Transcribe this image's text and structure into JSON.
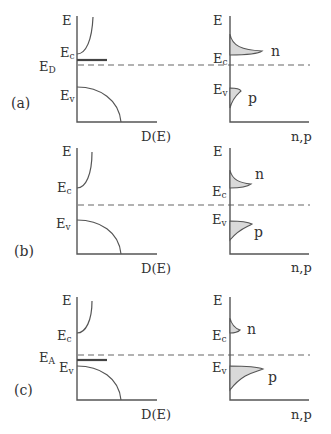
{
  "figure": {
    "panels": [
      {
        "id": "a",
        "tag": "(a)",
        "type": "n-type",
        "left": {
          "e_axis": "E",
          "ec": "E",
          "ec_sub": "c",
          "ev": "E",
          "ev_sub": "v",
          "level": "E",
          "level_sub": "D",
          "x_axis": "D(E)"
        },
        "right": {
          "e_axis": "E",
          "ec": "E",
          "ec_sub": "c",
          "ev": "E",
          "ev_sub": "v",
          "n_label": "n",
          "p_label": "p",
          "x_axis": "n,p"
        }
      },
      {
        "id": "b",
        "tag": "(b)",
        "type": "intrinsic",
        "left": {
          "e_axis": "E",
          "ec": "E",
          "ec_sub": "c",
          "ev": "E",
          "ev_sub": "v",
          "x_axis": "D(E)"
        },
        "right": {
          "e_axis": "E",
          "ec": "E",
          "ec_sub": "c",
          "ev": "E",
          "ev_sub": "v",
          "n_label": "n",
          "p_label": "p",
          "x_axis": "n,p"
        }
      },
      {
        "id": "c",
        "tag": "(c)",
        "type": "p-type",
        "left": {
          "e_axis": "E",
          "ec": "E",
          "ec_sub": "c",
          "ev": "E",
          "ev_sub": "v",
          "level": "E",
          "level_sub": "A",
          "x_axis": "D(E)"
        },
        "right": {
          "e_axis": "E",
          "ec": "E",
          "ec_sub": "c",
          "ev": "E",
          "ev_sub": "v",
          "n_label": "n",
          "p_label": "p",
          "x_axis": "n,p"
        }
      }
    ]
  }
}
